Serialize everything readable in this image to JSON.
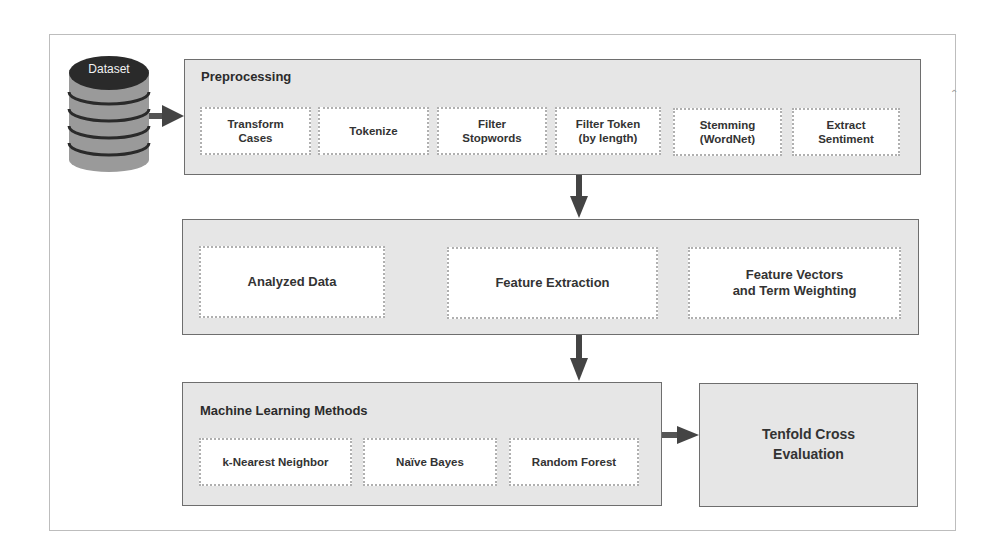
{
  "dataset": {
    "label": "Dataset",
    "icon": "database-icon"
  },
  "preprocessing": {
    "title": "Preprocessing",
    "steps": [
      {
        "line1": "Transform",
        "line2": "Cases"
      },
      {
        "line1": "Tokenize",
        "line2": ""
      },
      {
        "line1": "Filter",
        "line2": "Stopwords"
      },
      {
        "line1": "Filter Token",
        "line2": "(by length)"
      },
      {
        "line1": "Stemming",
        "line2": "(WordNet)"
      },
      {
        "line1": "Extract",
        "line2": "Sentiment"
      }
    ]
  },
  "feature_stage": {
    "steps": [
      {
        "line1": "Analyzed Data",
        "line2": ""
      },
      {
        "line1": "Feature Extraction",
        "line2": ""
      },
      {
        "line1": "Feature Vectors",
        "line2": "and Term Weighting"
      }
    ]
  },
  "ml_methods": {
    "title": "Machine Learning Methods",
    "methods": [
      "k-Nearest Neighbor",
      "Naïve Bayes",
      "Random Forest"
    ]
  },
  "evaluation": {
    "line1": "Tenfold Cross",
    "line2": "Evaluation"
  },
  "colors": {
    "panel_fill": "#e6e6e6",
    "panel_border": "#6e6e6e",
    "arrow": "#444444",
    "db_top": "#2a2a2a",
    "db_body": "#9a9a9a"
  }
}
